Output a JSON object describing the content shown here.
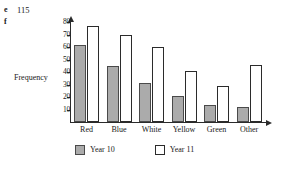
{
  "page": {
    "exercise_markers": [
      {
        "letter": "e",
        "number": "115"
      },
      {
        "letter": "f",
        "number": ""
      }
    ]
  },
  "legend": {
    "position": "bottom",
    "entries": [
      {
        "label": "Year 10",
        "swatch": "gray-filled-square",
        "color": "#ababab"
      },
      {
        "label": "Year 11",
        "swatch": "white-outlined-square",
        "color": "#ffffff"
      }
    ]
  },
  "axes": {
    "y_title": "Frequency",
    "y_ticks": [
      "10",
      "20",
      "30",
      "40",
      "50",
      "60",
      "70",
      "80"
    ]
  },
  "chart_data": {
    "type": "bar",
    "title": "",
    "xlabel": "",
    "ylabel": "Frequency",
    "ylim": [
      0,
      80
    ],
    "ytick_step": 10,
    "grid": false,
    "legend_position": "bottom",
    "categories": [
      "Red",
      "Blue",
      "White",
      "Yellow",
      "Green",
      "Other"
    ],
    "series": [
      {
        "name": "Year 10",
        "color": "#ababab",
        "values": [
          62,
          45,
          31,
          21,
          14,
          12
        ]
      },
      {
        "name": "Year 11",
        "color": "#ffffff",
        "values": [
          77,
          70,
          60,
          41,
          29,
          46
        ]
      }
    ]
  }
}
